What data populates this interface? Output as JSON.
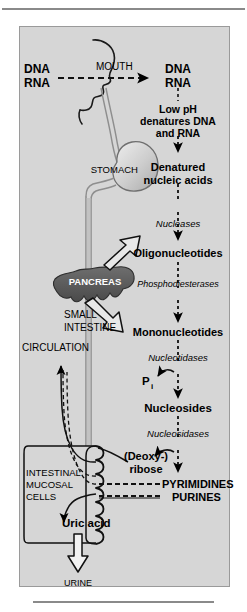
{
  "figure": {
    "background_color": "#d6d6d6",
    "panel_border_color": "#9a9a9a"
  },
  "anatomy": {
    "mouth_label": "MOUTH",
    "stomach_label": "STOMACH",
    "pancreas_label": "PANCREAS",
    "small_intestine_label_line1": "SMALL",
    "small_intestine_label_line2": "INTESTINE",
    "circulation_label": "CIRCULATION",
    "mucosal_label_line1": "INTESTINAL",
    "mucosal_label_line2": "MUCOSAL",
    "mucosal_label_line3": "CELLS",
    "urine_label": "URINE",
    "pancreas_fill": "#5e5e5e",
    "stomach_fill": "#cfcfcf"
  },
  "pathway": {
    "dietary_line1": "DNA",
    "dietary_line2": "RNA",
    "stomach_substrate_line1": "DNA",
    "stomach_substrate_line2": "RNA",
    "low_ph_line1": "Low pH",
    "low_ph_line2": "denatures DNA",
    "low_ph_line3": "and RNA",
    "denatured_line1": "Denatured",
    "denatured_line2": "nucleic acids",
    "oligonucleotides": "Oligonucleotides",
    "mononucleotides": "Mononucleotides",
    "nucleosides": "Nucleosides",
    "phosphate": "P",
    "phosphate_subscript": "i",
    "deoxyribose_line1": "(Deoxy-)",
    "deoxyribose_line2": "ribose",
    "pyrimidines": "PYRIMIDINES",
    "purines": "PURINES",
    "uric_acid": "Uric acid"
  },
  "enzymes": {
    "nucleases": "Nucleases",
    "phosphodiesterases": "Phosphodiesterases",
    "nucleotidases": "Nucleotidases",
    "nucleosidases": "Nucleosidases"
  }
}
